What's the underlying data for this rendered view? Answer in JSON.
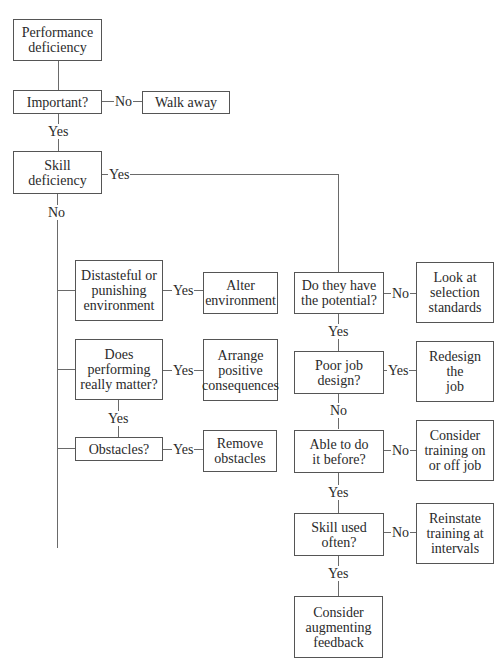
{
  "diagram": {
    "type": "flowchart",
    "title": "",
    "nodes": {
      "performance_deficiency": "Performance\ndeficiency",
      "important": "Important?",
      "walk_away": "Walk away",
      "skill_deficiency": "Skill\ndeficiency",
      "distasteful": "Distasteful or\npunishing\nenvironment",
      "alter_environment": "Alter\nenvironment",
      "does_performing_matter": "Does\nperforming\nreally matter?",
      "arrange_consequences": "Arrange\npositive\nconsequences",
      "obstacles": "Obstacles?",
      "remove_obstacles": "Remove\nobstacles",
      "potential": "Do they have\nthe potential?",
      "selection_standards": "Look at\nselection\nstandards",
      "poor_job_design": "Poor job\ndesign?",
      "redesign_job": "Redesign\nthe\njob",
      "able_before": "Able to do\nit before?",
      "consider_training": "Consider\ntraining on\nor off job",
      "skill_used_often": "Skill used\noften?",
      "reinstate_training": "Reinstate\ntraining at\nintervals",
      "augmenting_feedback": "Consider\naugmenting\nfeedback"
    },
    "edge_labels": {
      "important_no": "No",
      "important_yes": "Yes",
      "skill_yes": "Yes",
      "skill_no": "No",
      "distasteful_yes": "Yes",
      "matter_yes_right": "Yes",
      "matter_yes_down": "Yes",
      "obstacles_yes": "Yes",
      "potential_no": "No",
      "potential_yes": "Yes",
      "job_design_yes": "Yes",
      "job_design_no": "No",
      "able_no": "No",
      "able_yes": "Yes",
      "skill_used_no": "No",
      "skill_used_yes": "Yes"
    },
    "edges": [
      {
        "from": "performance_deficiency",
        "to": "important",
        "label": ""
      },
      {
        "from": "important",
        "to": "walk_away",
        "label": "No"
      },
      {
        "from": "important",
        "to": "skill_deficiency",
        "label": "Yes"
      },
      {
        "from": "skill_deficiency",
        "to": "potential",
        "label": "Yes"
      },
      {
        "from": "skill_deficiency",
        "to": "distasteful",
        "label": "No"
      },
      {
        "from": "skill_deficiency",
        "to": "does_performing_matter",
        "label": "No"
      },
      {
        "from": "skill_deficiency",
        "to": "obstacles",
        "label": "No"
      },
      {
        "from": "distasteful",
        "to": "alter_environment",
        "label": "Yes"
      },
      {
        "from": "does_performing_matter",
        "to": "arrange_consequences",
        "label": "Yes"
      },
      {
        "from": "does_performing_matter",
        "to": "obstacles",
        "label": "Yes"
      },
      {
        "from": "obstacles",
        "to": "remove_obstacles",
        "label": "Yes"
      },
      {
        "from": "potential",
        "to": "selection_standards",
        "label": "No"
      },
      {
        "from": "potential",
        "to": "poor_job_design",
        "label": "Yes"
      },
      {
        "from": "poor_job_design",
        "to": "redesign_job",
        "label": "Yes"
      },
      {
        "from": "poor_job_design",
        "to": "able_before",
        "label": "No"
      },
      {
        "from": "able_before",
        "to": "consider_training",
        "label": "No"
      },
      {
        "from": "able_before",
        "to": "skill_used_often",
        "label": "Yes"
      },
      {
        "from": "skill_used_often",
        "to": "reinstate_training",
        "label": "No"
      },
      {
        "from": "skill_used_often",
        "to": "augmenting_feedback",
        "label": "Yes"
      }
    ],
    "colors": {
      "stroke": "#555555",
      "text": "#2a2a2a",
      "background": "#ffffff"
    }
  }
}
